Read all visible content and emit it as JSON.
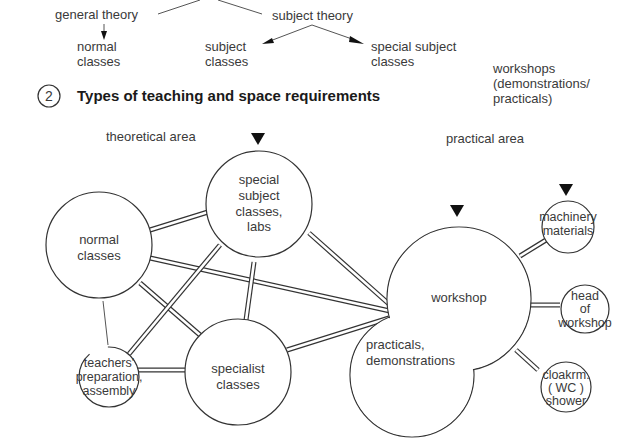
{
  "hierarchy": {
    "general_theory": "general theory",
    "subject_theory": "subject theory",
    "normal_classes": [
      "normal",
      "classes"
    ],
    "subject_classes": [
      "subject",
      "classes"
    ],
    "special_subject_classes": [
      "special subject",
      "classes"
    ],
    "workshops": [
      "workshops",
      "(demonstrations/",
      "practicals)"
    ]
  },
  "figure": {
    "number": "2",
    "title": "Types of teaching and space requirements"
  },
  "areas": {
    "theoretical": "theoretical area",
    "practical": "practical area"
  },
  "nodes": {
    "normal_classes": [
      "normal",
      "classes"
    ],
    "special_subject": [
      "special",
      "subject",
      "classes,",
      "labs"
    ],
    "specialist_classes": [
      "specialist",
      "classes"
    ],
    "teachers": [
      "teachers'",
      "preparation,",
      "assembly"
    ],
    "workshop": "workshop",
    "practicals": [
      "practicals,",
      "demonstrations"
    ],
    "machinery": [
      "machinery",
      "materials"
    ],
    "head": [
      "head",
      "of",
      "workshop"
    ],
    "cloakroom": [
      "cloakrm.",
      "(  WC  )",
      "shower"
    ]
  },
  "colors": {
    "stroke": "#333333",
    "text": "#3a3a3a",
    "background": "#ffffff"
  }
}
